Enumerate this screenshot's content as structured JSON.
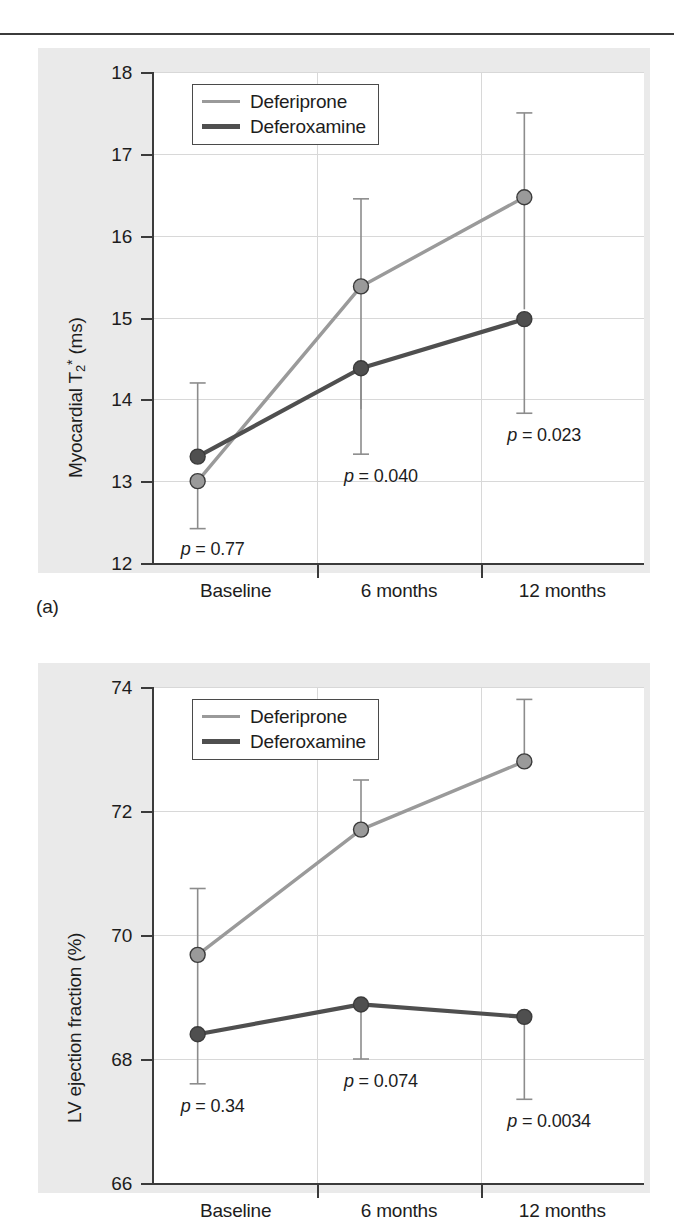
{
  "panels": [
    {
      "label": "(a)",
      "ylabel_html": "Myocardial T<sub>2</sub><sup>*</sup> (ms)",
      "ylabel_plain": "Myocardial T2* (ms)"
    },
    {
      "label": "(b)",
      "ylabel_html": "LV ejection fraction (%)",
      "ylabel_plain": "LV ejection fraction (%)"
    }
  ],
  "legend": {
    "deferiprone_label": "Deferiprone",
    "deferoxamine_label": "Deferoxamine",
    "deferiprone_color": "#9a9a9a",
    "deferoxamine_color": "#4f4f4f"
  },
  "chart_data": [
    {
      "type": "line",
      "title": "",
      "panel": "(a)",
      "xlabel": "",
      "ylabel": "Myocardial T2* (ms)",
      "categories": [
        "Baseline",
        "6 months",
        "12 months"
      ],
      "yticks": [
        12,
        13,
        14,
        15,
        16,
        17,
        18
      ],
      "ytick_labels": [
        "12",
        "13",
        "14",
        "15",
        "16",
        "17",
        "18"
      ],
      "ylim": [
        12,
        18
      ],
      "grid": true,
      "legend_position": "top-left",
      "series": [
        {
          "name": "Deferiprone",
          "color": "#9a9a9a",
          "values": [
            13.0,
            15.38,
            16.47
          ],
          "err_low": [
            12.42,
            13.88,
            15.1
          ],
          "err_high": [
            13.0,
            16.45,
            17.5
          ]
        },
        {
          "name": "Deferoxamine",
          "color": "#4f4f4f",
          "values": [
            13.3,
            14.38,
            14.98
          ],
          "err_low": [
            13.3,
            13.33,
            13.83
          ],
          "err_high": [
            14.2,
            14.38,
            14.98
          ]
        }
      ],
      "annotations": [
        {
          "text": "p = 0.77",
          "category": "Baseline"
        },
        {
          "text": "p = 0.040",
          "category": "6 months"
        },
        {
          "text": "p = 0.023",
          "category": "12 months"
        }
      ]
    },
    {
      "type": "line",
      "title": "",
      "panel": "(b)",
      "xlabel": "",
      "ylabel": "LV ejection fraction (%)",
      "categories": [
        "Baseline",
        "6 months",
        "12 months"
      ],
      "yticks": [
        66,
        68,
        70,
        72,
        74
      ],
      "ytick_labels": [
        "66",
        "68",
        "70",
        "72",
        "74"
      ],
      "ylim": [
        66,
        74
      ],
      "grid": true,
      "legend_position": "top-left",
      "series": [
        {
          "name": "Deferiprone",
          "color": "#9a9a9a",
          "values": [
            69.68,
            71.7,
            72.8
          ],
          "err_low": [
            68.3,
            71.7,
            72.8
          ],
          "err_high": [
            70.75,
            72.5,
            73.8
          ]
        },
        {
          "name": "Deferoxamine",
          "color": "#4f4f4f",
          "values": [
            68.4,
            68.88,
            68.68
          ],
          "err_low": [
            67.6,
            68.0,
            67.35
          ],
          "err_high": [
            68.4,
            68.88,
            68.68
          ]
        }
      ],
      "annotations": [
        {
          "text": "p = 0.34",
          "category": "Baseline"
        },
        {
          "text": "p = 0.074",
          "category": "6 months"
        },
        {
          "text": "p = 0.0034",
          "category": "12 months"
        }
      ]
    }
  ]
}
